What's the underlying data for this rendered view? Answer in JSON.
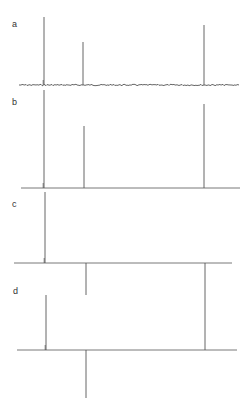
{
  "chart_data": {
    "type": "line",
    "title": "",
    "xlabel": "",
    "ylabel": "",
    "grid": false,
    "legend": null,
    "peak_positions_px": [
      44,
      84,
      205
    ],
    "panels": [
      {
        "label": "a",
        "baseline_y": 85,
        "x_start": 19,
        "x_end": 239,
        "noisy_baseline": true,
        "peaks": [
          {
            "x": 44,
            "top_y": 17,
            "rel_intensity": 1.0
          },
          {
            "x": 83,
            "top_y": 42,
            "rel_intensity": 0.63
          },
          {
            "x": 204,
            "top_y": 25,
            "rel_intensity": 0.88
          }
        ]
      },
      {
        "label": "b",
        "baseline_y": 188,
        "x_start": 21,
        "x_end": 240,
        "noisy_baseline": false,
        "peaks": [
          {
            "x": 44,
            "top_y": 90,
            "rel_intensity": 1.0
          },
          {
            "x": 84,
            "top_y": 126,
            "rel_intensity": 0.63
          },
          {
            "x": 204,
            "top_y": 104,
            "rel_intensity": 0.86
          }
        ]
      },
      {
        "label": "c",
        "baseline_y": 263,
        "x_start": 14,
        "x_end": 232,
        "noisy_baseline": false,
        "peaks": [
          {
            "x": 45,
            "top_y": 192,
            "rel_intensity": 1.0
          },
          {
            "x": 86,
            "top_y": 295,
            "rel_intensity": -0.45
          },
          {
            "x": 205,
            "top_y": 310,
            "rel_intensity": -0.66
          }
        ]
      },
      {
        "label": "d",
        "baseline_y": 350,
        "x_start": 17,
        "x_end": 237,
        "noisy_baseline": false,
        "peaks": [
          {
            "x": 46,
            "top_y": 295,
            "rel_intensity": 1.0
          },
          {
            "x": 86,
            "top_y": 398,
            "rel_intensity": -0.87
          },
          {
            "x": 205,
            "top_y": 310,
            "rel_intensity": 0.73
          }
        ]
      }
    ]
  },
  "labels": {
    "a": "a",
    "b": "b",
    "c": "c",
    "d": "d"
  },
  "colors": {
    "trace": "#555555",
    "label": "#333333"
  }
}
